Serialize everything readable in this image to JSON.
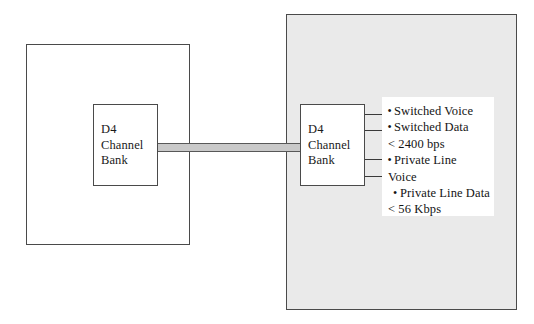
{
  "diagram": {
    "colors": {
      "network_cloud_fill": "#eaeaea",
      "premises_fill": "#ffffff",
      "box_fill": "#ffffff",
      "border": "#4a4a4a",
      "trunk_fill": "#c9c9c9",
      "trunk_border": "#585858",
      "text": "#141414"
    },
    "nodes": [
      {
        "id": "premises",
        "type": "enclosure",
        "label": ""
      },
      {
        "id": "network",
        "type": "enclosure",
        "label": ""
      },
      {
        "id": "d4_left",
        "type": "box",
        "label": "D4\nChannel\nBank"
      },
      {
        "id": "d4_right",
        "type": "box",
        "label": "D4\nChannel\nBank"
      }
    ],
    "trunk": {
      "label": "",
      "from": "d4_left",
      "to": "d4_right"
    },
    "services": [
      {
        "text": "Switched Voice",
        "bullet": "bullet",
        "has_leader": true
      },
      {
        "text": "Switched Data",
        "bullet": "bullet",
        "has_leader": true
      },
      {
        "text": "< 2400 bps",
        "bullet": "none",
        "has_leader": false
      },
      {
        "text": "Private Line",
        "bullet": "bullet",
        "has_leader": true
      },
      {
        "text": "Voice",
        "bullet": "none",
        "has_leader": true
      },
      {
        "text": "Private Line Data",
        "bullet": "indent-bullet",
        "has_leader": false
      },
      {
        "text": "< 56 Kbps",
        "bullet": "none",
        "has_leader": false
      }
    ]
  }
}
